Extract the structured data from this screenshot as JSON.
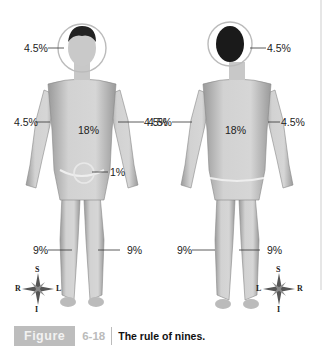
{
  "figure": {
    "front_view": {
      "labels": {
        "head": "4.5%",
        "right_arm": "4.5%",
        "left_arm": "4.5%",
        "trunk": "18%",
        "genitals": "1%",
        "right_leg": "9%",
        "left_leg": "9%"
      },
      "compass": {
        "top": "S",
        "bottom": "I",
        "left": "R",
        "right": "L"
      }
    },
    "back_view": {
      "labels": {
        "head": "4.5%",
        "left_arm": "4.5%",
        "right_arm": "4.5%",
        "trunk": "18%",
        "left_leg": "9%",
        "right_leg": "9%"
      },
      "compass": {
        "top": "S",
        "bottom": "I",
        "left": "L",
        "right": "R"
      }
    }
  },
  "caption": {
    "figure_word": "Figure",
    "figure_number": "6-18",
    "text": "The rule of nines."
  }
}
